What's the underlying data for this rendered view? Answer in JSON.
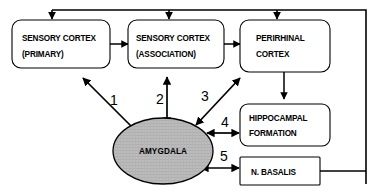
{
  "diagram": {
    "background_color": "#ffffff",
    "line_color": "#000000",
    "amygdala_fill_color": "#b9b9b9",
    "nodes": [
      {
        "id": "sensory-cortex-primary",
        "shape": "rounded-rect",
        "line1": "SENSORY CORTEX",
        "line2": "(PRIMARY)"
      },
      {
        "id": "sensory-cortex-association",
        "shape": "rounded-rect",
        "line1": "SENSORY CORTEX",
        "line2": "(ASSOCIATION)"
      },
      {
        "id": "perirhinal-cortex",
        "shape": "rounded-rect",
        "line1": "PERIRHINAL",
        "line2": "CORTEX"
      },
      {
        "id": "hippocampal-formation",
        "shape": "rounded-rect",
        "line1": "HIPPOCAMPAL",
        "line2": "FORMATION"
      },
      {
        "id": "nucleus-basalis",
        "shape": "rect",
        "line1": "N. BASALIS",
        "line2": ""
      },
      {
        "id": "amygdala",
        "shape": "ellipse",
        "line1": "AMYGDALA",
        "line2": ""
      }
    ],
    "path_numbers": [
      {
        "id": "path-1",
        "label": "1",
        "connects": "amygdala-to-sensory-cortex-primary",
        "arrowheads": "single"
      },
      {
        "id": "path-2",
        "label": "2",
        "connects": "amygdala-to-sensory-cortex-association",
        "arrowheads": "double"
      },
      {
        "id": "path-3",
        "label": "3",
        "connects": "amygdala-to-perirhinal-cortex",
        "arrowheads": "double"
      },
      {
        "id": "path-4",
        "label": "4",
        "connects": "amygdala-to-hippocampal-formation",
        "arrowheads": "double"
      },
      {
        "id": "path-5",
        "label": "5",
        "connects": "amygdala-to-nucleus-basalis",
        "arrowheads": "double"
      }
    ]
  }
}
